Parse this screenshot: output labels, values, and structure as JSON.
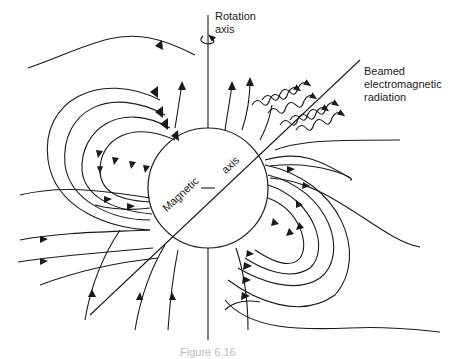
{
  "labels": {
    "rotation_axis": [
      "Rotation",
      "axis"
    ],
    "beamed_radiation": [
      "Beamed",
      "electromagnetic",
      "radiation"
    ],
    "magnetic": "Magnetic",
    "axis": "axis",
    "caption": "Figure 6.16"
  },
  "colors": {
    "stroke": "#1a1a1a",
    "background": "#ffffff"
  }
}
